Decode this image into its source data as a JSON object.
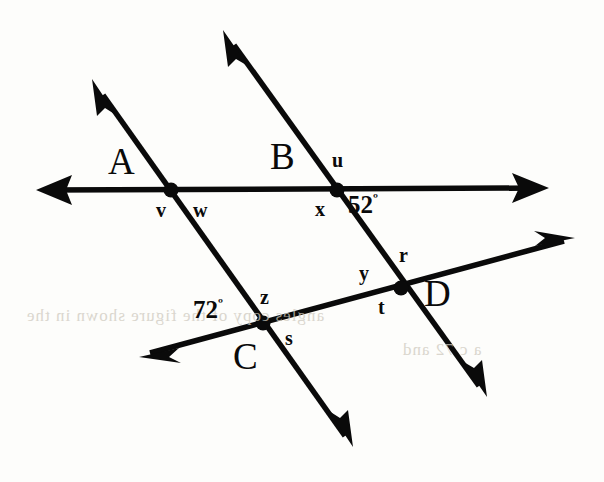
{
  "figure": {
    "background_color": "#fdfdfb",
    "ink_color": "#0a0a0a"
  },
  "vertices": [
    {
      "name": "A",
      "label": "A",
      "x": 171,
      "y": 190,
      "label_x": 108,
      "label_y": 143
    },
    {
      "name": "B",
      "label": "B",
      "x": 337,
      "y": 190,
      "label_x": 270,
      "label_y": 138
    },
    {
      "name": "C",
      "label": "C",
      "x": 263,
      "y": 323,
      "label_x": 233,
      "label_y": 338
    },
    {
      "name": "D",
      "label": "D",
      "x": 401,
      "y": 288,
      "label_x": 424,
      "label_y": 275
    }
  ],
  "angle_labels": [
    {
      "name": "v",
      "text": "v",
      "x": 156,
      "y": 200
    },
    {
      "name": "w",
      "text": "w",
      "x": 193,
      "y": 200
    },
    {
      "name": "u",
      "text": "u",
      "x": 332,
      "y": 150
    },
    {
      "name": "x",
      "text": "x",
      "x": 315,
      "y": 199
    },
    {
      "name": "z",
      "text": "z",
      "x": 260,
      "y": 287
    },
    {
      "name": "s",
      "text": "s",
      "x": 285,
      "y": 328
    },
    {
      "name": "y",
      "text": "y",
      "x": 359,
      "y": 263
    },
    {
      "name": "r",
      "text": "r",
      "x": 399,
      "y": 245
    },
    {
      "name": "t",
      "text": "t",
      "x": 378,
      "y": 297
    }
  ],
  "angle_measures": [
    {
      "name": "angle-52",
      "value": "52",
      "degree_symbol": "º",
      "x": 348,
      "y": 192
    },
    {
      "name": "angle-72",
      "value": "72",
      "degree_symbol": "º",
      "x": 193,
      "y": 297
    }
  ],
  "lines": [
    {
      "name": "horizontal-transversal",
      "description": "Horizontal line through A and B, arrowheads both ends",
      "from": {
        "x": 40,
        "y": 190
      },
      "to": {
        "x": 548,
        "y": 188
      },
      "arrow_start": true,
      "arrow_end": true
    },
    {
      "name": "line-through-A-and-C",
      "description": "Line through A and C, arrowheads both ends",
      "from": {
        "x": 93,
        "y": 81
      },
      "to": {
        "x": 352,
        "y": 446
      },
      "arrow_start": true,
      "arrow_end": true
    },
    {
      "name": "line-through-B-and-D",
      "description": "Line through B and D, arrowheads both ends",
      "from": {
        "x": 224,
        "y": 31
      },
      "to": {
        "x": 486,
        "y": 396
      },
      "arrow_start": true,
      "arrow_end": true
    },
    {
      "name": "line-through-C-and-D",
      "description": "Line through C and D, arrowheads both ends",
      "from": {
        "x": 141,
        "y": 356
      },
      "to": {
        "x": 574,
        "y": 238
      },
      "arrow_start": true,
      "arrow_end": true
    }
  ],
  "bleed_through": [
    {
      "name": "bleed-line-1",
      "text": "angles  copy    of    the    figure     shown    in the",
      "x": 26,
      "y": 306,
      "rotate": -1
    },
    {
      "name": "bleed-line-2",
      "text": "a  c        72  and",
      "x": 402,
      "y": 340,
      "rotate": -1
    }
  ]
}
